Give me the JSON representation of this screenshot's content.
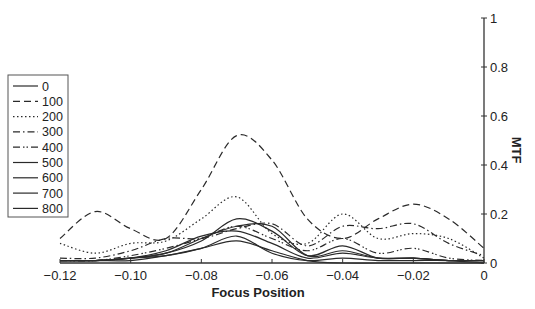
{
  "chart_data": {
    "type": "line",
    "title": "",
    "xlabel": "Focus Position",
    "ylabel": "MTF",
    "xlim": [
      -0.12,
      0
    ],
    "ylim": [
      0,
      1
    ],
    "x_ticks": [
      "-0.12",
      "-0.10",
      "-0.08",
      "-0.06",
      "-0.04",
      "-0.02",
      "0"
    ],
    "y_ticks": [
      "0",
      "0.2",
      "0.4",
      "0.6",
      "0.8",
      "1"
    ],
    "grid": false,
    "legend_position": "left",
    "x": [
      -0.12,
      -0.11,
      -0.1,
      -0.09,
      -0.08,
      -0.07,
      -0.06,
      -0.05,
      -0.04,
      -0.03,
      -0.02,
      -0.01,
      0
    ],
    "series": [
      {
        "name": "0",
        "style": "solid",
        "values": [
          0.01,
          0.01,
          0.01,
          0.03,
          0.06,
          0.09,
          0.05,
          0.01,
          0.0,
          0.0,
          0.0,
          0.0,
          0.0
        ]
      },
      {
        "name": "100",
        "style": "dashed",
        "values": [
          0.1,
          0.21,
          0.14,
          0.1,
          0.3,
          0.52,
          0.42,
          0.18,
          0.1,
          0.18,
          0.24,
          0.18,
          0.06
        ]
      },
      {
        "name": "200",
        "style": "dotted",
        "values": [
          0.08,
          0.04,
          0.08,
          0.09,
          0.18,
          0.27,
          0.12,
          0.08,
          0.2,
          0.1,
          0.12,
          0.1,
          0.02
        ]
      },
      {
        "name": "300",
        "style": "dash-dot",
        "values": [
          0.02,
          0.02,
          0.05,
          0.1,
          0.1,
          0.14,
          0.16,
          0.07,
          0.15,
          0.14,
          0.16,
          0.08,
          0.03
        ]
      },
      {
        "name": "400",
        "style": "dash-dot-dot",
        "values": [
          0.01,
          0.01,
          0.03,
          0.06,
          0.1,
          0.15,
          0.1,
          0.05,
          0.1,
          0.04,
          0.06,
          0.02,
          0.01
        ]
      },
      {
        "name": "500",
        "style": "solid",
        "values": [
          0.01,
          0.01,
          0.02,
          0.04,
          0.09,
          0.18,
          0.13,
          0.03,
          0.07,
          0.02,
          0.02,
          0.01,
          0.01
        ]
      },
      {
        "name": "600",
        "style": "solid",
        "values": [
          0.01,
          0.01,
          0.02,
          0.04,
          0.1,
          0.15,
          0.15,
          0.03,
          0.05,
          0.02,
          0.02,
          0.01,
          0.01
        ]
      },
      {
        "name": "700",
        "style": "solid",
        "values": [
          0.01,
          0.01,
          0.02,
          0.05,
          0.11,
          0.13,
          0.08,
          0.02,
          0.04,
          0.02,
          0.02,
          0.01,
          0.01
        ]
      },
      {
        "name": "800",
        "style": "solid",
        "values": [
          0.01,
          0.01,
          0.02,
          0.03,
          0.06,
          0.11,
          0.04,
          0.01,
          0.02,
          0.01,
          0.01,
          0.01,
          0.0
        ]
      }
    ]
  }
}
